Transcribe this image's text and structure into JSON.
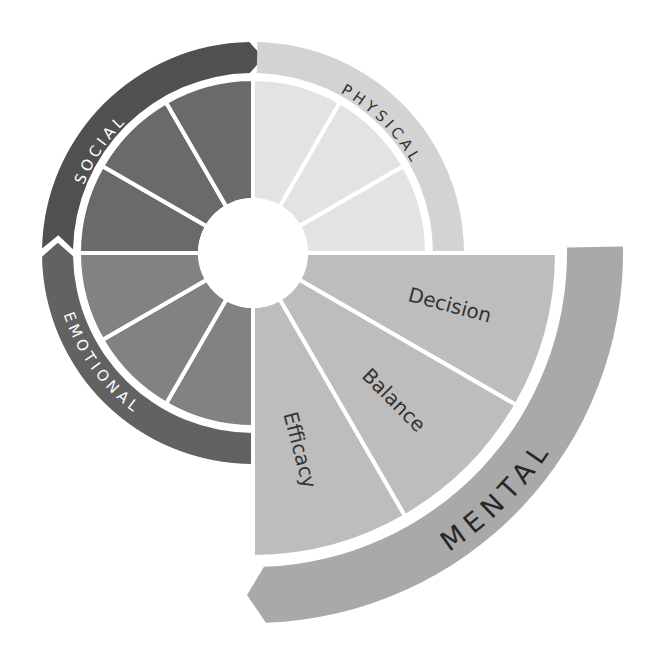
{
  "diagram": {
    "center": [
      253,
      253
    ],
    "hole_radius": 55,
    "quadrants": [
      {
        "id": "social",
        "label": "SOCIAL",
        "start_deg": 180,
        "end_deg": 270,
        "wedge_color": "#6a6a6a",
        "ring_color": "#505050",
        "label_color": "#ffffff",
        "wedge_radius": 174,
        "ring_inner": 180,
        "ring_outer": 211,
        "segments": 3,
        "segment_labels": [
          "",
          "",
          ""
        ]
      },
      {
        "id": "physical",
        "label": "PHYSICAL",
        "start_deg": 270,
        "end_deg": 360,
        "wedge_color": "#e3e3e3",
        "ring_color": "#d3d3d3",
        "label_color": "#333333",
        "wedge_radius": 174,
        "ring_inner": 180,
        "ring_outer": 211,
        "segments": 3,
        "segment_labels": [
          "",
          "",
          ""
        ]
      },
      {
        "id": "emotional",
        "label": "EMOTIONAL",
        "start_deg": 90,
        "end_deg": 180,
        "wedge_color": "#828282",
        "ring_color": "#626262",
        "label_color": "#ffffff",
        "wedge_radius": 174,
        "ring_inner": 180,
        "ring_outer": 211,
        "segments": 3,
        "segment_labels": [
          "",
          "",
          ""
        ]
      },
      {
        "id": "mental",
        "label": "MENTAL",
        "start_deg": 0,
        "end_deg": 90,
        "wedge_color": "#bdbdbd",
        "ring_color": "#a9a9a9",
        "label_color": "#262626",
        "wedge_radius": 304,
        "ring_inner": 314,
        "ring_outer": 370,
        "segments": 3,
        "segment_labels": [
          "Decision",
          "Balance",
          "Efficacy"
        ]
      }
    ],
    "divider_color": "#ffffff"
  }
}
